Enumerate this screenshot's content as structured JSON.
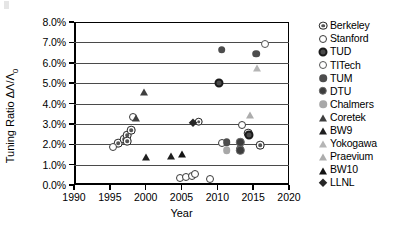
{
  "chart_data": {
    "type": "scatter",
    "title": "",
    "xlabel": "Year",
    "ylabel": "Tuning Ratio",
    "ylabel_symbol": "ΔΛ/Λ",
    "ylabel_subscript": "0",
    "xlim": [
      1990,
      2020
    ],
    "ylim": [
      0.0,
      8.0
    ],
    "xticks": [
      "1990",
      "1995",
      "2000",
      "2005",
      "2010",
      "2015",
      "2020"
    ],
    "xtick_values": [
      1990,
      1995,
      2000,
      2005,
      2010,
      2015,
      2020
    ],
    "yticks": [
      "0.0%",
      "1.0%",
      "2.0%",
      "3.0%",
      "4.0%",
      "5.0%",
      "6.0%",
      "7.0%",
      "8.0%"
    ],
    "ytick_values": [
      0.0,
      1.0,
      2.0,
      3.0,
      4.0,
      5.0,
      6.0,
      7.0,
      8.0
    ],
    "grid": "horizontal",
    "legend_position": "right",
    "yunit": "percent",
    "series": [
      {
        "name": "Berkeley",
        "marker": "bullseye-circle",
        "color": "#2b2b2b",
        "fill": "#555555",
        "points": [
          {
            "x": 1996.2,
            "y": 2.05
          },
          {
            "x": 1997.0,
            "y": 2.25
          },
          {
            "x": 1997.4,
            "y": 2.45
          },
          {
            "x": 1997.4,
            "y": 2.15
          },
          {
            "x": 1998.0,
            "y": 2.7
          },
          {
            "x": 2007.4,
            "y": 3.1
          },
          {
            "x": 2014.3,
            "y": 2.55
          },
          {
            "x": 2016.0,
            "y": 1.95
          }
        ]
      },
      {
        "name": "Stanford",
        "marker": "open-circle",
        "color": "#3a3a3a",
        "fill": "none",
        "points": [
          {
            "x": 1995.4,
            "y": 1.85
          },
          {
            "x": 1998.3,
            "y": 3.35
          },
          {
            "x": 2004.8,
            "y": 0.35
          },
          {
            "x": 2005.6,
            "y": 0.4
          },
          {
            "x": 2006.4,
            "y": 0.45
          },
          {
            "x": 2006.9,
            "y": 0.55
          },
          {
            "x": 2009.0,
            "y": 0.3
          },
          {
            "x": 2010.6,
            "y": 2.05
          },
          {
            "x": 2013.2,
            "y": 1.75
          },
          {
            "x": 2013.4,
            "y": 2.95
          }
        ]
      },
      {
        "name": "TUD",
        "marker": "bold-ring-circle",
        "color": "#1a1a1a",
        "fill": "#4a4a4a",
        "points": [
          {
            "x": 2010.2,
            "y": 5.0
          },
          {
            "x": 2014.4,
            "y": 2.45
          }
        ]
      },
      {
        "name": "TITech",
        "marker": "thin-open-circle",
        "color": "#555555",
        "fill": "none",
        "points": [
          {
            "x": 2016.6,
            "y": 6.9
          }
        ]
      },
      {
        "name": "TUM",
        "marker": "filled-circle",
        "color": "#4d4d4d",
        "fill": "#4d4d4d",
        "points": [
          {
            "x": 2010.6,
            "y": 6.65
          },
          {
            "x": 2015.4,
            "y": 6.45
          },
          {
            "x": 2011.3,
            "y": 2.1
          }
        ]
      },
      {
        "name": "DTU",
        "marker": "ringed-filled-circle",
        "color": "#6b6b6b",
        "fill": "#3d3d3d",
        "points": [
          {
            "x": 2013.2,
            "y": 2.1
          },
          {
            "x": 2013.2,
            "y": 1.7
          }
        ]
      },
      {
        "name": "Chalmers",
        "marker": "gray-filled-circle",
        "color": "#a8a8a8",
        "fill": "#a8a8a8",
        "points": [
          {
            "x": 2011.3,
            "y": 1.7
          }
        ]
      },
      {
        "name": "Coretek",
        "marker": "dark-triangle",
        "color": "#3f3f3f",
        "fill": "#3f3f3f",
        "points": [
          {
            "x": 1999.7,
            "y": 4.6
          },
          {
            "x": 1998.6,
            "y": 3.35
          }
        ]
      },
      {
        "name": "BW9",
        "marker": "black-triangle",
        "color": "#1f1f1f",
        "fill": "#1f1f1f",
        "points": [
          {
            "x": 2000.0,
            "y": 1.4
          },
          {
            "x": 2003.6,
            "y": 1.45
          }
        ]
      },
      {
        "name": "Yokogawa",
        "marker": "light-triangle",
        "color": "#b5b5b5",
        "fill": "#b5b5b5",
        "points": [
          {
            "x": 2015.5,
            "y": 5.8
          }
        ]
      },
      {
        "name": "Praevium",
        "marker": "light-gray-triangle",
        "color": "#adadad",
        "fill": "#adadad",
        "points": [
          {
            "x": 2014.6,
            "y": 3.5
          }
        ]
      },
      {
        "name": "BW10",
        "marker": "solid-triangle",
        "color": "#141414",
        "fill": "#141414",
        "points": [
          {
            "x": 2005.0,
            "y": 1.55
          }
        ]
      },
      {
        "name": "LLNL",
        "marker": "diamond",
        "color": "#262626",
        "fill": "#262626",
        "points": [
          {
            "x": 2006.6,
            "y": 3.05
          }
        ]
      }
    ]
  },
  "legend": {
    "items": [
      {
        "label": "Berkeley"
      },
      {
        "label": "Stanford"
      },
      {
        "label": "TUD"
      },
      {
        "label": "TITech"
      },
      {
        "label": "TUM"
      },
      {
        "label": "DTU"
      },
      {
        "label": "Chalmers"
      },
      {
        "label": "Coretek"
      },
      {
        "label": "BW9"
      },
      {
        "label": "Yokogawa"
      },
      {
        "label": "Praevium"
      },
      {
        "label": "BW10"
      },
      {
        "label": "LLNL"
      }
    ]
  }
}
